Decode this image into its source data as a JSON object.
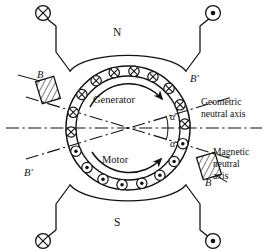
{
  "figure": {
    "title_text": "",
    "pole_north_label": "N",
    "pole_south_label": "S",
    "generator_label": "Generator",
    "motor_label": "Motor",
    "angle_label_upper": "α",
    "angle_label_lower": "α",
    "brush_label_upper_left": "B",
    "brush_label_lower_right": "B",
    "brush_label_upper_right": "B′",
    "brush_label_lower_left": "B′",
    "geometric_axis_line1": "Geometric",
    "geometric_axis_line2": "neutral axis",
    "magnetic_axis_line1": "Magnetic",
    "magnetic_axis_line2": "neutral",
    "magnetic_axis_line3": "axis",
    "field_coil_top_left_symbol": "⊗",
    "field_coil_top_right_symbol": "⊙",
    "field_coil_bottom_left_symbol": "⊗",
    "field_coil_bottom_right_symbol": "⊙",
    "conductor_cross_symbol": "⊗",
    "conductor_dot_symbol": "⊙",
    "colors": {
      "stroke": "#111111",
      "background": "#ffffff",
      "hatch": "#111111"
    }
  },
  "chart_data": {
    "type": "diagram",
    "center": {
      "x": 128,
      "y": 128
    },
    "armature_outer_radius": 62,
    "armature_inner_radius": 52,
    "conductor_radius": 57,
    "conductor_marker_radius": 5.2,
    "geometric_neutral_axis_angle_deg": 0,
    "magnetic_neutral_axis_shift_alpha_deg": 17,
    "conductors": [
      {
        "index": 0,
        "angle_deg": 104,
        "symbol": "⊗"
      },
      {
        "index": 1,
        "angle_deg": 124,
        "symbol": "⊗"
      },
      {
        "index": 2,
        "angle_deg": 144,
        "symbol": "⊗"
      },
      {
        "index": 3,
        "angle_deg": 164,
        "symbol": "⊗"
      },
      {
        "index": 4,
        "angle_deg": 184,
        "symbol": "⊗"
      },
      {
        "index": 5,
        "angle_deg": 204,
        "symbol": "⊙"
      },
      {
        "index": 6,
        "angle_deg": 224,
        "symbol": "⊙"
      },
      {
        "index": 7,
        "angle_deg": 244,
        "symbol": "⊙"
      },
      {
        "index": 8,
        "angle_deg": 264,
        "symbol": "⊙"
      },
      {
        "index": 9,
        "angle_deg": 284,
        "symbol": "⊙"
      },
      {
        "index": 10,
        "angle_deg": 304,
        "symbol": "⊙"
      },
      {
        "index": 11,
        "angle_deg": 324,
        "symbol": "⊙"
      },
      {
        "index": 12,
        "angle_deg": 344,
        "symbol": "⊙"
      },
      {
        "index": 13,
        "angle_deg": 4,
        "symbol": "⊗"
      },
      {
        "index": 14,
        "angle_deg": 24,
        "symbol": "⊗"
      },
      {
        "index": 15,
        "angle_deg": 44,
        "symbol": "⊗"
      },
      {
        "index": 16,
        "angle_deg": 64,
        "symbol": "⊗"
      },
      {
        "index": 17,
        "angle_deg": 84,
        "symbol": "⊗"
      }
    ],
    "brushes": [
      {
        "name": "upper-left",
        "angle_deg": 163,
        "label": "B"
      },
      {
        "name": "lower-right",
        "angle_deg": 343,
        "label": "B"
      }
    ],
    "rotation_arrows": [
      {
        "name": "generator",
        "direction": "clockwise",
        "label": "Generator"
      },
      {
        "name": "motor",
        "direction": "clockwise",
        "label": "Motor"
      }
    ],
    "field_coils": [
      {
        "position": "top-left",
        "symbol": "⊗"
      },
      {
        "position": "top-right",
        "symbol": "⊙"
      },
      {
        "position": "bottom-left",
        "symbol": "⊗"
      },
      {
        "position": "bottom-right",
        "symbol": "⊙"
      }
    ],
    "axis_lines": [
      {
        "name": "geometric-neutral-axis",
        "style": "dash-dot",
        "angle_deg": 0
      },
      {
        "name": "magnetic-neutral-axis-generator",
        "style": "dash-dot",
        "angle_deg": 17
      },
      {
        "name": "magnetic-neutral-axis-motor",
        "style": "dash-dot",
        "angle_deg": -17
      }
    ]
  }
}
